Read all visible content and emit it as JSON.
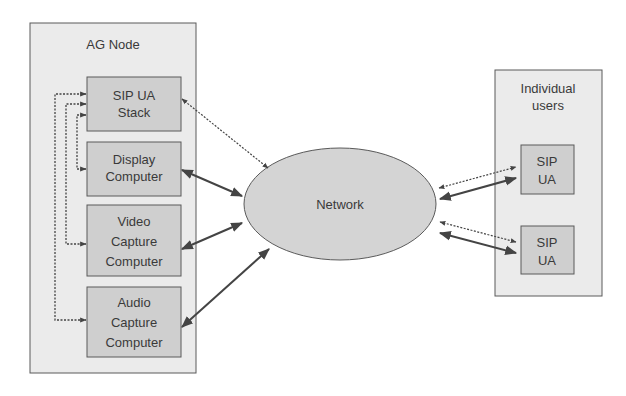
{
  "diagram": {
    "type": "network-architecture",
    "colors": {
      "outer_fill": "#ebebeb",
      "inner_fill": "#cfcfcf",
      "network_fill": "#d4d4d4",
      "stroke": "#555555",
      "arrow": "#444444"
    },
    "ag_node": {
      "title": "AG Node",
      "components": [
        {
          "id": "sip_ua_stack",
          "lines": [
            "SIP UA",
            "Stack"
          ]
        },
        {
          "id": "display_computer",
          "lines": [
            "Display",
            "Computer"
          ]
        },
        {
          "id": "video_capture_computer",
          "lines": [
            "Video",
            "Capture",
            "Computer"
          ]
        },
        {
          "id": "audio_capture_computer",
          "lines": [
            "Audio",
            "Capture",
            "Computer"
          ]
        }
      ]
    },
    "network": {
      "label": "Network"
    },
    "individual_users": {
      "title_lines": [
        "Individual",
        "users"
      ],
      "components": [
        {
          "id": "sip_ua_1",
          "lines": [
            "SIP",
            "UA"
          ]
        },
        {
          "id": "sip_ua_2",
          "lines": [
            "SIP",
            "UA"
          ]
        }
      ]
    },
    "connections": [
      {
        "from": "sip_ua_stack",
        "to": "network",
        "style": "dotted",
        "direction": "bidirectional"
      },
      {
        "from": "display_computer",
        "to": "network",
        "style": "solid",
        "direction": "bidirectional"
      },
      {
        "from": "video_capture_computer",
        "to": "network",
        "style": "solid",
        "direction": "bidirectional"
      },
      {
        "from": "audio_capture_computer",
        "to": "network",
        "style": "solid",
        "direction": "bidirectional"
      },
      {
        "from": "sip_ua_stack",
        "to": "display_computer",
        "style": "dotted",
        "direction": "bidirectional"
      },
      {
        "from": "sip_ua_stack",
        "to": "video_capture_computer",
        "style": "dotted",
        "direction": "bidirectional"
      },
      {
        "from": "sip_ua_stack",
        "to": "audio_capture_computer",
        "style": "dotted",
        "direction": "bidirectional"
      },
      {
        "from": "network",
        "to": "sip_ua_1",
        "style": "dotted",
        "direction": "bidirectional"
      },
      {
        "from": "network",
        "to": "sip_ua_1",
        "style": "solid",
        "direction": "bidirectional"
      },
      {
        "from": "network",
        "to": "sip_ua_2",
        "style": "dotted",
        "direction": "bidirectional"
      },
      {
        "from": "network",
        "to": "sip_ua_2",
        "style": "solid",
        "direction": "bidirectional"
      }
    ]
  }
}
